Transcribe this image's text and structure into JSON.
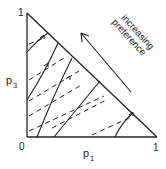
{
  "diagram": {
    "type": "probability-triangle",
    "title": "",
    "axes": {
      "x": {
        "label": "p",
        "subscript": "1",
        "min_label": "0",
        "max_label": "1"
      },
      "y": {
        "label": "p",
        "subscript": "3",
        "max_label": "1"
      }
    },
    "annotation": {
      "line1": "increasing",
      "line2": "preference",
      "arrow_direction": "up-left"
    },
    "colors": {
      "ink": "#222222",
      "background": "#ffffff"
    },
    "series": [
      {
        "name": "indifference-curves",
        "style": "solid",
        "count": 5
      },
      {
        "name": "iso-expected-value-lines",
        "style": "dashed",
        "count": 7
      }
    ]
  }
}
